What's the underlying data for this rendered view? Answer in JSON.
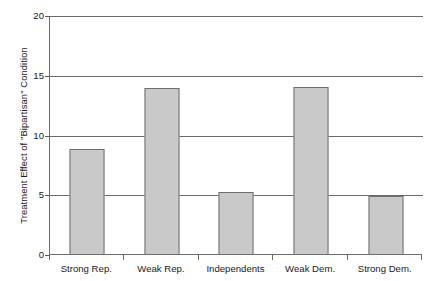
{
  "chart_data": {
    "type": "bar",
    "title": "",
    "subtitle": "",
    "xlabel": "",
    "ylabel": "Treatment Effect of \"Bipartisan\" Condition",
    "categories": [
      "Strong Rep.",
      "Weak Rep.",
      "Independents",
      "Weak Dem.",
      "Strong Dem."
    ],
    "values": [
      8.9,
      14.0,
      5.25,
      14.1,
      4.9
    ],
    "series": [
      {
        "name": "Treatment Effect of \"Bipartisan\" Condition",
        "values": [
          8.9,
          14.0,
          5.25,
          14.1,
          4.9
        ]
      }
    ],
    "ylim": [
      0,
      20
    ],
    "yticks": [
      0,
      5,
      10,
      15,
      20
    ],
    "ytick_labels": [
      "0",
      "5",
      "10",
      "15",
      "20"
    ],
    "grid": true,
    "grid_axis": "y",
    "legend": false,
    "legend_position": "none",
    "annotations": [],
    "colors": {
      "bar_fill": "#c9c9c9",
      "bar_border": "#6e6e6e",
      "gridline": "#6b6b6b",
      "axis": "#6b6b6b",
      "text": "#1a1a1a",
      "background": "#ffffff"
    }
  },
  "axes": {
    "y": {
      "ticks": [
        {
          "label": "20",
          "value": 20
        },
        {
          "label": "15",
          "value": 15
        },
        {
          "label": "10",
          "value": 10
        },
        {
          "label": "5",
          "value": 5
        },
        {
          "label": "0",
          "value": 0
        }
      ]
    },
    "x": {
      "ticks": [
        {
          "label": "Strong Rep."
        },
        {
          "label": "Weak Rep."
        },
        {
          "label": "Independents"
        },
        {
          "label": "Weak Dem."
        },
        {
          "label": "Strong Dem."
        }
      ]
    }
  }
}
